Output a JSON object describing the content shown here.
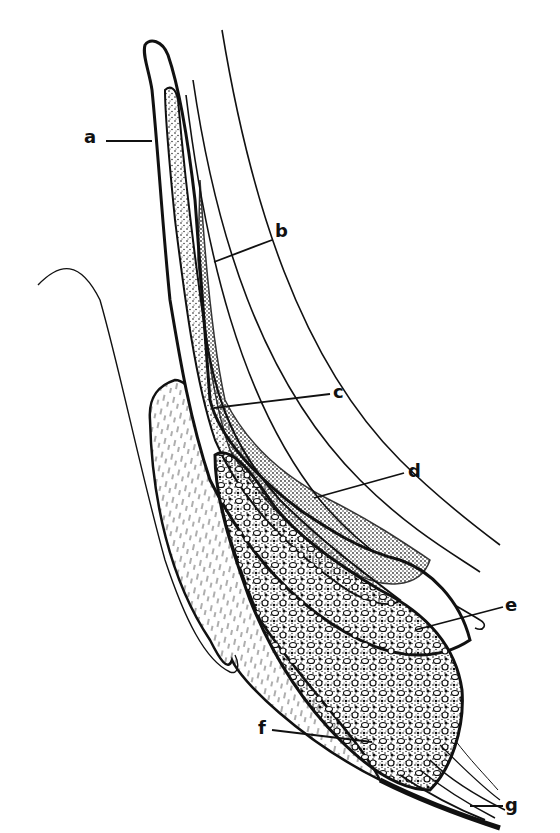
{
  "figure": {
    "type": "anatomical line drawing",
    "colors": {
      "ink": "#111111",
      "background": "#ffffff"
    },
    "labels": [
      {
        "id": "a",
        "text": "a",
        "x": 86,
        "y": 131,
        "leader": [
          [
            106,
            141
          ],
          [
            150,
            141
          ]
        ]
      },
      {
        "id": "b",
        "text": "b",
        "x": 276,
        "y": 226,
        "leader": [
          [
            272,
            238
          ],
          [
            214,
            262
          ]
        ]
      },
      {
        "id": "c",
        "text": "c",
        "x": 333,
        "y": 385,
        "leader": [
          [
            330,
            393
          ],
          [
            214,
            408
          ]
        ]
      },
      {
        "id": "d",
        "text": "d",
        "x": 408,
        "y": 464,
        "leader": [
          [
            404,
            472
          ],
          [
            314,
            498
          ]
        ]
      },
      {
        "id": "e",
        "text": "e",
        "x": 505,
        "y": 597,
        "leader": [
          [
            503,
            606
          ],
          [
            415,
            628
          ]
        ]
      },
      {
        "id": "f",
        "text": "f",
        "x": 258,
        "y": 722,
        "leader": [
          [
            272,
            729
          ],
          [
            370,
            742
          ]
        ]
      },
      {
        "id": "g",
        "text": "g",
        "x": 505,
        "y": 798,
        "leader": [
          [
            503,
            805
          ],
          [
            472,
            805
          ]
        ]
      }
    ]
  }
}
